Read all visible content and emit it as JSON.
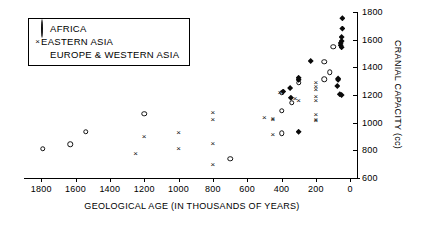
{
  "chart_data": {
    "type": "scatter",
    "title": "",
    "xlabel": "GEOLOGICAL AGE (IN THOUSANDS OF YEARS)",
    "ylabel": "CRANIAL CAPACITY (cc)",
    "xlim": [
      1900,
      -40
    ],
    "ylim": [
      600,
      1800
    ],
    "x_ticks": [
      1800,
      1600,
      1400,
      1200,
      1000,
      800,
      600,
      400,
      200,
      0
    ],
    "y_ticks": [
      600,
      800,
      1000,
      1200,
      1400,
      1600,
      1800
    ],
    "x_inverted": true,
    "grid": false,
    "legend_position": "top-left",
    "series": [
      {
        "name": "AFRICA",
        "marker": "open-circle",
        "color": "#111111",
        "points": [
          [
            1790,
            810
          ],
          [
            1630,
            845
          ],
          [
            1540,
            935
          ],
          [
            1200,
            1065
          ],
          [
            700,
            740
          ],
          [
            400,
            1085
          ],
          [
            400,
            925
          ],
          [
            300,
            1290
          ],
          [
            400,
            1215
          ],
          [
            340,
            1145
          ],
          [
            150,
            1440
          ],
          [
            150,
            1315
          ],
          [
            120,
            1365
          ],
          [
            100,
            1550
          ]
        ]
      },
      {
        "name": "EASTERN ASIA",
        "marker": "cross",
        "color": "#111111",
        "points": [
          [
            1250,
            780
          ],
          [
            1200,
            905
          ],
          [
            1000,
            935
          ],
          [
            1000,
            820
          ],
          [
            800,
            1075
          ],
          [
            800,
            1030
          ],
          [
            800,
            850
          ],
          [
            800,
            700
          ],
          [
            500,
            1040
          ],
          [
            450,
            1035
          ],
          [
            450,
            1025
          ],
          [
            450,
            920
          ],
          [
            410,
            1220
          ],
          [
            320,
            1180
          ],
          [
            300,
            1165
          ],
          [
            200,
            1295
          ],
          [
            200,
            1265
          ],
          [
            200,
            1245
          ],
          [
            200,
            1195
          ],
          [
            200,
            1165
          ],
          [
            200,
            1060
          ],
          [
            200,
            1030
          ],
          [
            200,
            1020
          ]
        ]
      },
      {
        "name": "EUROPE & WESTERN ASIA",
        "marker": "filled-diamond",
        "color": "#0a0a0a",
        "points": [
          [
            390,
            1225
          ],
          [
            350,
            1250
          ],
          [
            345,
            1180
          ],
          [
            300,
            1325
          ],
          [
            300,
            1310
          ],
          [
            300,
            935
          ],
          [
            230,
            1445
          ],
          [
            70,
            1320
          ],
          [
            70,
            1310
          ],
          [
            75,
            1265
          ],
          [
            60,
            1205
          ],
          [
            50,
            1200
          ],
          [
            55,
            1560
          ],
          [
            50,
            1590
          ],
          [
            55,
            1575
          ],
          [
            50,
            1545
          ],
          [
            50,
            1620
          ],
          [
            45,
            1680
          ],
          [
            45,
            1755
          ]
        ]
      }
    ]
  },
  "legend": {
    "items": [
      {
        "label": "AFRICA",
        "marker": "open-circle"
      },
      {
        "label": "EASTERN ASIA",
        "marker": "cross"
      },
      {
        "label": "EUROPE & WESTERN ASIA",
        "marker": "filled-diamond"
      }
    ]
  },
  "cross_glyph": "×"
}
